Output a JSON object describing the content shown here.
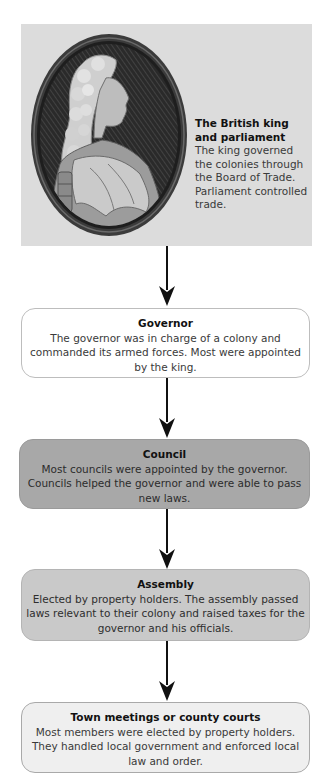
{
  "top": {
    "title": "The British king and parliament",
    "title_line1": "The British king",
    "title_line2": "and parliament",
    "body": "The king governed the colonies through the Board of Trade. Parliament controlled trade.",
    "image": "portrait-of-king-in-oval-frame"
  },
  "boxes": [
    {
      "title": "Governor",
      "body": "The governor was in charge of a colony and commanded its armed forces. Most were appointed by the king.",
      "fill": "#ffffff"
    },
    {
      "title": "Council",
      "body": "Most councils were appointed by the governor. Councils helped the governor and were able to pass new laws.",
      "fill": "#a8a8a8"
    },
    {
      "title": "Assembly",
      "body": "Elected by property holders. The assembly passed laws relevant to their colony and raised taxes for the governor and his officials.",
      "fill": "#c9c9c9"
    },
    {
      "title": "Town meetings or county courts",
      "body": "Most members were elected by property holders. They handled local government and enforced local law and order.",
      "fill": "#efefef"
    }
  ],
  "arrows": {
    "icon": "down-arrow-icon",
    "color": "#111111"
  },
  "colors": {
    "top_panel": "#dcdcdc",
    "text": "#3a3a3a",
    "title": "#111111"
  }
}
